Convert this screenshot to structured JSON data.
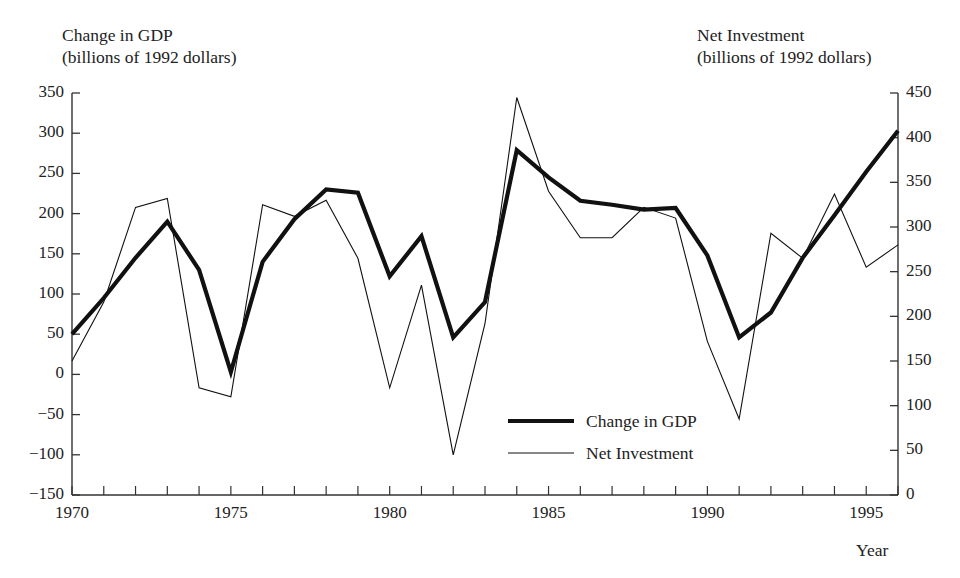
{
  "titles": {
    "left_line1": "Change in GDP",
    "left_line2": "(billions of 1992 dollars)",
    "right_line1": "Net Investment",
    "right_line2": "(billions of 1992 dollars)",
    "xaxis": "Year"
  },
  "legend": {
    "items": [
      {
        "label": "Change in GDP",
        "style": "thick"
      },
      {
        "label": "Net Investment",
        "style": "thin"
      }
    ]
  },
  "axes": {
    "left_ticks": [
      "350",
      "300",
      "250",
      "200",
      "150",
      "100",
      "50",
      "0",
      "−50",
      "−100",
      "−150"
    ],
    "right_ticks": [
      "450",
      "400",
      "350",
      "300",
      "250",
      "200",
      "150",
      "100",
      "50",
      "0"
    ],
    "x_ticks": [
      "1970",
      "1975",
      "1980",
      "1985",
      "1990",
      "1995"
    ]
  },
  "chart_data": {
    "type": "line",
    "xlabel": "Year",
    "ylabel": "Change in GDP (billions of 1992 dollars)",
    "y2label": "Net Investment (billions of 1992 dollars)",
    "grid": false,
    "legend_position": "inside-bottom-center",
    "xlim": [
      1970,
      1996
    ],
    "ylim": [
      -150,
      350
    ],
    "y2lim": [
      0,
      450
    ],
    "x": [
      1970,
      1971,
      1972,
      1973,
      1974,
      1975,
      1976,
      1977,
      1978,
      1979,
      1980,
      1981,
      1982,
      1983,
      1984,
      1985,
      1986,
      1987,
      1988,
      1989,
      1990,
      1991,
      1992,
      1993,
      1994,
      1995,
      1996
    ],
    "series": [
      {
        "name": "Change in GDP",
        "axis": "left",
        "style": "thick",
        "units": "billions of 1992 dollars",
        "values": [
          50,
          95,
          145,
          190,
          130,
          3,
          140,
          193,
          230,
          226,
          122,
          172,
          46,
          90,
          279,
          245,
          216,
          211,
          205,
          207,
          148,
          46,
          77,
          145,
          198,
          252,
          303
        ]
      },
      {
        "name": "Net Investment",
        "axis": "right",
        "style": "thin",
        "units": "billions of 1992 dollars",
        "values": [
          150,
          216,
          322,
          332,
          120,
          110,
          325,
          312,
          330,
          265,
          120,
          235,
          45,
          192,
          445,
          340,
          288,
          288,
          322,
          310,
          172,
          85,
          293,
          265,
          337,
          255,
          280
        ]
      }
    ]
  }
}
